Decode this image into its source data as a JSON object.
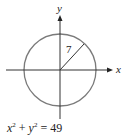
{
  "diagram": {
    "type": "circle-on-axes",
    "x_axis_label": "x",
    "y_axis_label": "y",
    "radius_label": "7",
    "equation": {
      "x_var": "x",
      "y_var": "y",
      "exponent": "2",
      "plus": "+",
      "equals": "=",
      "rhs": "49"
    },
    "colors": {
      "circle": "#7a7a7a",
      "axes": "#333333",
      "radius": "#333333",
      "text": "#222222"
    },
    "geometry": {
      "center": [
        60,
        70
      ],
      "radius_px": 36
    }
  }
}
